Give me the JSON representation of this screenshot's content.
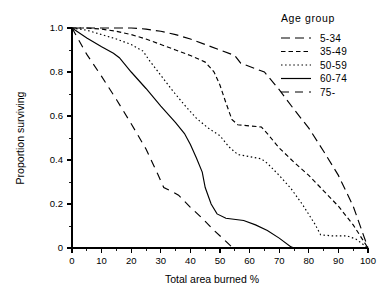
{
  "chart_data": {
    "type": "line",
    "title": "",
    "xlabel": "Total area burned  %",
    "ylabel": "Proportion surviving",
    "xlim": [
      0,
      100
    ],
    "ylim": [
      0,
      1.0
    ],
    "grid": false,
    "legend_position": "top-right",
    "legend_title": "Age group",
    "x_ticks": [
      0,
      10,
      20,
      30,
      40,
      50,
      60,
      70,
      80,
      90,
      100
    ],
    "x_tick_labels": [
      "0",
      "10",
      "20",
      "30",
      "40",
      "50",
      "60",
      "70",
      "80",
      "90",
      "100"
    ],
    "x_minor_step": 5,
    "y_ticks": [
      0,
      0.2,
      0.4,
      0.6,
      0.8,
      1.0
    ],
    "y_tick_labels": [
      "0",
      "0.2",
      "0.4",
      "0.6",
      "0.8",
      "1.0"
    ],
    "y_minor_step": 0.1,
    "series": [
      {
        "name": "5-34",
        "line_style": "long-dash",
        "dash_array": "9,5",
        "points": [
          [
            0,
            1.0
          ],
          [
            10,
            1.0
          ],
          [
            20,
            1.0
          ],
          [
            25,
            0.995
          ],
          [
            30,
            0.985
          ],
          [
            35,
            0.97
          ],
          [
            40,
            0.95
          ],
          [
            45,
            0.925
          ],
          [
            50,
            0.9
          ],
          [
            55,
            0.875
          ],
          [
            57,
            0.84
          ],
          [
            60,
            0.825
          ],
          [
            65,
            0.8
          ],
          [
            70,
            0.72
          ],
          [
            75,
            0.63
          ],
          [
            80,
            0.545
          ],
          [
            85,
            0.44
          ],
          [
            90,
            0.33
          ],
          [
            95,
            0.19
          ],
          [
            100,
            0.0
          ]
        ]
      },
      {
        "name": "35-49",
        "line_style": "short-dash",
        "dash_array": "4.5,3",
        "points": [
          [
            0,
            1.0
          ],
          [
            5,
            1.0
          ],
          [
            10,
            0.995
          ],
          [
            15,
            0.985
          ],
          [
            20,
            0.97
          ],
          [
            25,
            0.95
          ],
          [
            30,
            0.925
          ],
          [
            35,
            0.9
          ],
          [
            40,
            0.875
          ],
          [
            45,
            0.845
          ],
          [
            48,
            0.8
          ],
          [
            50,
            0.74
          ],
          [
            52,
            0.66
          ],
          [
            54,
            0.585
          ],
          [
            56,
            0.56
          ],
          [
            60,
            0.555
          ],
          [
            64,
            0.55
          ],
          [
            66,
            0.52
          ],
          [
            70,
            0.455
          ],
          [
            75,
            0.39
          ],
          [
            80,
            0.33
          ],
          [
            85,
            0.26
          ],
          [
            90,
            0.19
          ],
          [
            95,
            0.105
          ],
          [
            100,
            0.0
          ]
        ]
      },
      {
        "name": "50-59",
        "line_style": "dotted",
        "dash_array": "1.5,2.6",
        "points": [
          [
            0,
            1.0
          ],
          [
            5,
            0.99
          ],
          [
            10,
            0.97
          ],
          [
            15,
            0.95
          ],
          [
            20,
            0.925
          ],
          [
            24,
            0.895
          ],
          [
            26,
            0.855
          ],
          [
            30,
            0.785
          ],
          [
            34,
            0.715
          ],
          [
            38,
            0.65
          ],
          [
            42,
            0.59
          ],
          [
            46,
            0.545
          ],
          [
            50,
            0.51
          ],
          [
            53,
            0.46
          ],
          [
            56,
            0.425
          ],
          [
            60,
            0.415
          ],
          [
            64,
            0.405
          ],
          [
            66,
            0.385
          ],
          [
            70,
            0.33
          ],
          [
            74,
            0.27
          ],
          [
            78,
            0.195
          ],
          [
            82,
            0.11
          ],
          [
            84,
            0.06
          ],
          [
            88,
            0.055
          ],
          [
            93,
            0.055
          ],
          [
            96,
            0.04
          ],
          [
            100,
            0.0
          ]
        ]
      },
      {
        "name": "60-74",
        "line_style": "solid",
        "dash_array": "",
        "points": [
          [
            0,
            1.0
          ],
          [
            5,
            0.955
          ],
          [
            10,
            0.915
          ],
          [
            14,
            0.885
          ],
          [
            16,
            0.865
          ],
          [
            20,
            0.8
          ],
          [
            25,
            0.725
          ],
          [
            30,
            0.645
          ],
          [
            35,
            0.57
          ],
          [
            38,
            0.52
          ],
          [
            40,
            0.47
          ],
          [
            42,
            0.41
          ],
          [
            44,
            0.345
          ],
          [
            45,
            0.275
          ],
          [
            47,
            0.2
          ],
          [
            49,
            0.155
          ],
          [
            52,
            0.135
          ],
          [
            58,
            0.125
          ],
          [
            62,
            0.105
          ],
          [
            66,
            0.08
          ],
          [
            70,
            0.045
          ],
          [
            74,
            0.005
          ],
          [
            75,
            0.0
          ],
          [
            100,
            0.0
          ]
        ]
      },
      {
        "name": "75-",
        "line_style": "long-dash-wide",
        "dash_array": "8,6",
        "points": [
          [
            0,
            1.0
          ],
          [
            5,
            0.88
          ],
          [
            10,
            0.78
          ],
          [
            15,
            0.675
          ],
          [
            20,
            0.565
          ],
          [
            25,
            0.45
          ],
          [
            29,
            0.335
          ],
          [
            31,
            0.275
          ],
          [
            34,
            0.255
          ],
          [
            36,
            0.24
          ],
          [
            40,
            0.185
          ],
          [
            44,
            0.135
          ],
          [
            48,
            0.08
          ],
          [
            52,
            0.03
          ],
          [
            54,
            0.005
          ],
          [
            54.5,
            0.0
          ]
        ]
      }
    ]
  },
  "legend": {
    "title": "Age group",
    "entries": [
      {
        "label": "5-34",
        "dash_array": "9,5"
      },
      {
        "label": "35-49",
        "dash_array": "4.5,3"
      },
      {
        "label": "50-59",
        "dash_array": "1.5,2.6"
      },
      {
        "label": "60-74",
        "dash_array": ""
      },
      {
        "label": "75-",
        "dash_array": "8,6"
      }
    ]
  }
}
